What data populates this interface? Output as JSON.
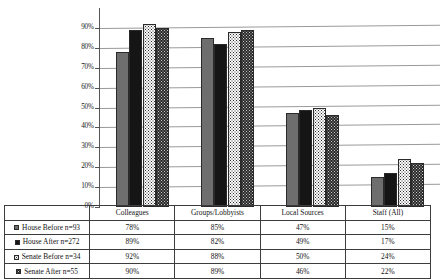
{
  "chart_data": {
    "type": "bar",
    "title": "",
    "xlabel": "",
    "ylabel": "",
    "ylim": [
      0,
      90
    ],
    "grid": true,
    "legend_position": "table-below",
    "categories": [
      "Colleagues",
      "Groups/Lobbyists",
      "Local Sources",
      "Staff (All)"
    ],
    "ytick_labels": [
      "90%",
      "80%",
      "70%",
      "60%",
      "50%",
      "40%",
      "30%",
      "20%",
      "10%",
      "0%"
    ],
    "ytick_values": [
      90,
      80,
      70,
      60,
      50,
      40,
      30,
      20,
      10,
      0
    ],
    "series": [
      {
        "name": "House Before n=93",
        "swatch": "gray-solid",
        "values": [
          78,
          85,
          47,
          15
        ],
        "labels": [
          "78%",
          "85%",
          "47%",
          "15%"
        ]
      },
      {
        "name": "House After n=272",
        "swatch": "black-solid",
        "values": [
          89,
          82,
          49,
          17
        ],
        "labels": [
          "89%",
          "82%",
          "49%",
          "17%"
        ]
      },
      {
        "name": "Senate Before n=34",
        "swatch": "white-dotted",
        "values": [
          92,
          88,
          50,
          24
        ],
        "labels": [
          "92%",
          "88%",
          "50%",
          "24%"
        ]
      },
      {
        "name": "Senate After n=55",
        "swatch": "dark-dotted",
        "values": [
          90,
          89,
          46,
          22
        ],
        "labels": [
          "90%",
          "89%",
          "46%",
          "22%"
        ]
      }
    ]
  }
}
